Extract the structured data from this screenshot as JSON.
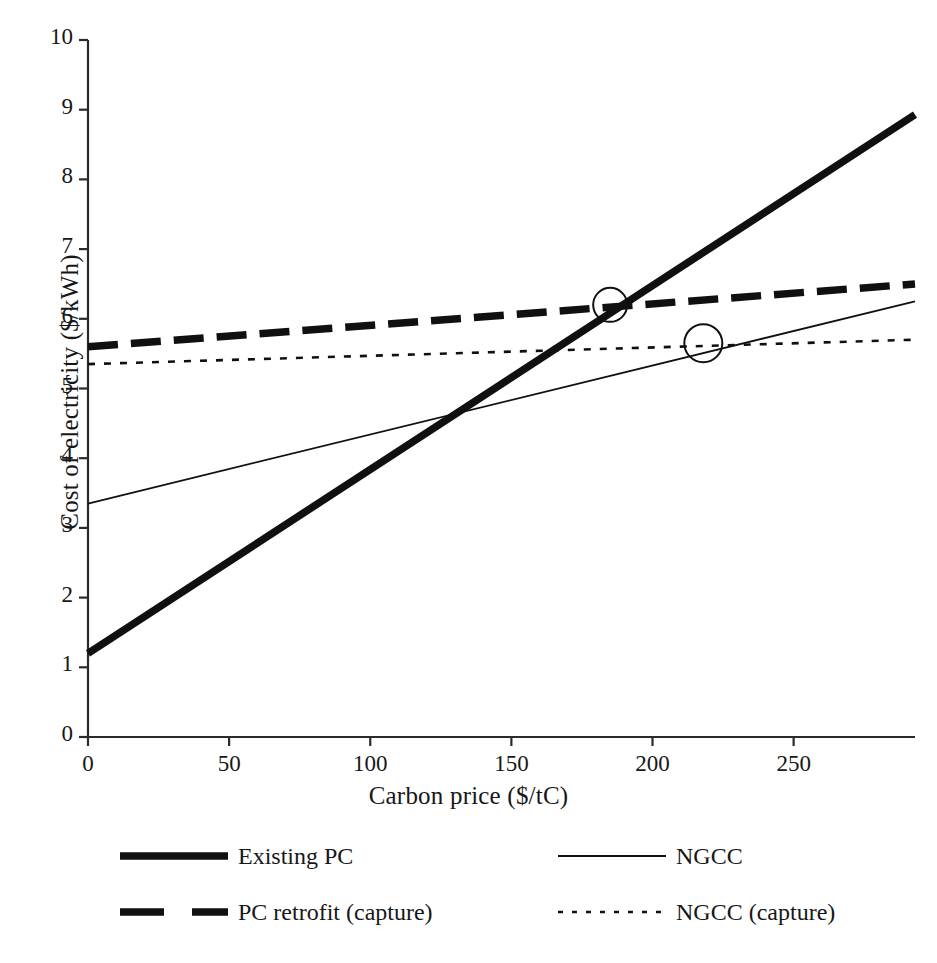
{
  "chart_data": {
    "type": "line",
    "title": "",
    "xlabel": "Carbon price ($/tC)",
    "ylabel": "Cost of electricity ($/kWh)",
    "xlim": [
      0,
      293
    ],
    "ylim": [
      0,
      10
    ],
    "xticks": [
      0,
      50,
      100,
      150,
      200,
      250
    ],
    "xtick_labels": [
      "0",
      "50",
      "100",
      "150",
      "200",
      "250"
    ],
    "yticks": [
      0,
      1,
      2,
      3,
      4,
      5,
      6,
      7,
      8,
      9,
      10
    ],
    "ytick_labels": [
      "0",
      "1",
      "2",
      "3",
      "4",
      "5",
      "6",
      "7",
      "8",
      "9",
      "10"
    ],
    "grid": false,
    "legend_position": "below-axes",
    "series": [
      {
        "name": "Existing PC",
        "style": "thick-solid",
        "color": "#101010",
        "x": [
          0,
          293
        ],
        "y": [
          1.2,
          8.93
        ]
      },
      {
        "name": "NGCC",
        "style": "thin-solid",
        "color": "#101010",
        "x": [
          0,
          293
        ],
        "y": [
          3.35,
          6.25
        ]
      },
      {
        "name": "PC retrofit (capture)",
        "style": "thick-dashed",
        "color": "#101010",
        "x": [
          0,
          293
        ],
        "y": [
          5.6,
          6.5
        ]
      },
      {
        "name": "NGCC (capture)",
        "style": "dotted",
        "color": "#101010",
        "x": [
          0,
          293
        ],
        "y": [
          5.35,
          5.7
        ]
      }
    ],
    "annotations": [
      {
        "name": "crossover-marker-1",
        "shape": "circle",
        "x": 185,
        "y": 6.2,
        "radius_px": 17,
        "note": "Existing PC crosses PC retrofit (capture)"
      },
      {
        "name": "crossover-marker-2",
        "shape": "circle",
        "x": 218,
        "y": 5.65,
        "radius_px": 19,
        "note": "NGCC crosses NGCC (capture)"
      }
    ]
  },
  "legend": {
    "entries": [
      {
        "label": "Existing PC",
        "style": "thick-solid"
      },
      {
        "label": "NGCC",
        "style": "thin-solid"
      },
      {
        "label": "PC retrofit (capture)",
        "style": "thick-dashed"
      },
      {
        "label": "NGCC (capture)",
        "style": "dotted"
      }
    ]
  },
  "colors": {
    "line": "#101010",
    "axis": "#2b2b2b",
    "text": "#171717",
    "background": "#ffffff"
  }
}
